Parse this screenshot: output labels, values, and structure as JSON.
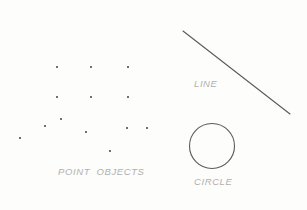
{
  "figure": {
    "background_color": "#fdfdfc",
    "width": 307,
    "height": 210,
    "stroke_color": "#5a5a60",
    "marker_color": "#6e6e74",
    "label_color": "#b0b0ae"
  },
  "labels": {
    "point_objects": "POINT  OBJECTS",
    "line": "LINE",
    "circle": "CIRCLE"
  },
  "chart_data": {
    "type": "scatter",
    "title": "",
    "subtitle": "",
    "xlabel": "",
    "ylabel": "",
    "grid": false,
    "legend": "none",
    "xlim": [
      0,
      307
    ],
    "ylim": [
      0,
      210
    ],
    "annotations": [
      {
        "text": "POINT  OBJECTS",
        "x": 58,
        "y": 172
      },
      {
        "text": "LINE",
        "x": 194,
        "y": 84
      },
      {
        "text": "CIRCLE",
        "x": 194,
        "y": 182
      }
    ],
    "series": [
      {
        "name": "point objects",
        "type": "scatter",
        "marker": "square",
        "marker_size": 2,
        "color": "#6e6e74",
        "points": [
          {
            "x": 57,
            "y": 67
          },
          {
            "x": 91,
            "y": 67
          },
          {
            "x": 128,
            "y": 67
          },
          {
            "x": 57,
            "y": 97
          },
          {
            "x": 91,
            "y": 97
          },
          {
            "x": 128,
            "y": 97
          },
          {
            "x": 61,
            "y": 119
          },
          {
            "x": 45,
            "y": 126
          },
          {
            "x": 86,
            "y": 132
          },
          {
            "x": 127,
            "y": 128
          },
          {
            "x": 147,
            "y": 128
          },
          {
            "x": 20,
            "y": 138
          },
          {
            "x": 110,
            "y": 151
          }
        ]
      },
      {
        "name": "line",
        "type": "line",
        "color": "#5a5a60",
        "width": 1,
        "x": [
          183,
          290
        ],
        "y": [
          31,
          114
        ]
      },
      {
        "name": "circle",
        "type": "circle",
        "color": "#5a5a60",
        "width": 1,
        "fill": "none",
        "center_x": 212,
        "center_y": 146,
        "radius": 22.5
      }
    ]
  }
}
